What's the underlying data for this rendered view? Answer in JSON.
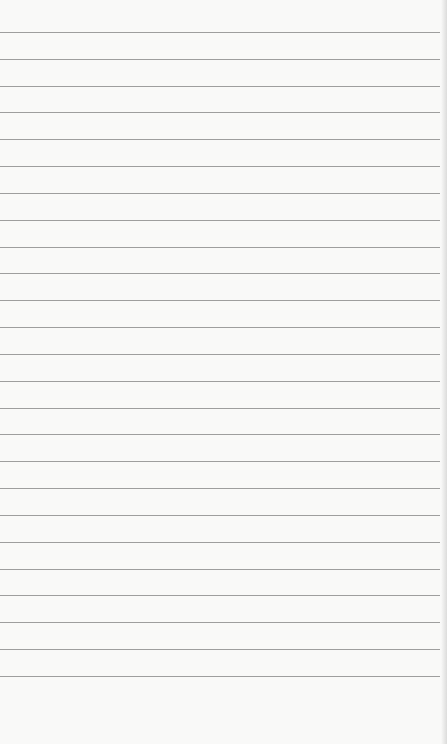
{
  "paper": {
    "type": "lined-notepad",
    "background_color": "#f9f9f8",
    "rule_color": "#8e8e8e",
    "rule_count": 25,
    "first_rule_y": 32,
    "rule_spacing": 26.83,
    "text": ""
  }
}
